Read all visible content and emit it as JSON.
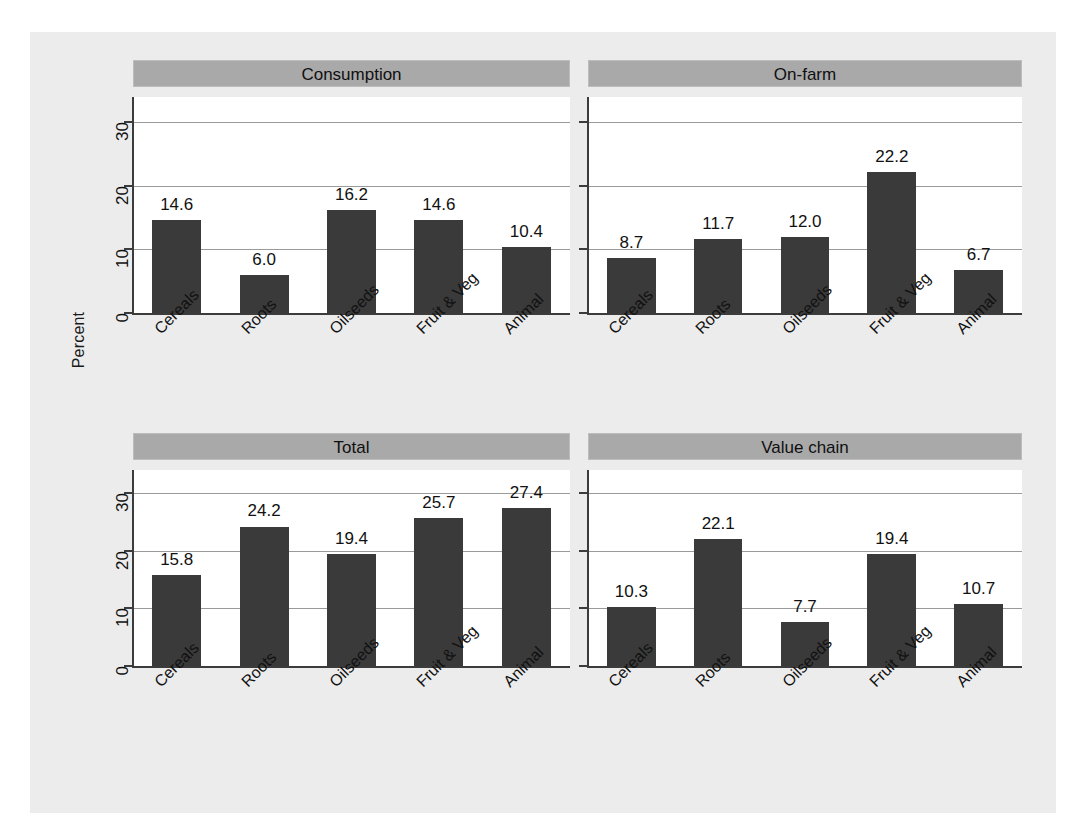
{
  "figure": {
    "ylabel": "Percent",
    "background": "#ececec",
    "bar_color": "#3a3a3a",
    "header_color": "#a9a9a9"
  },
  "chart_data": {
    "type": "bar",
    "title": "",
    "xlabel": "",
    "ylabel": "Percent",
    "ylim": [
      0,
      34
    ],
    "yticks": [
      0,
      10,
      20,
      30
    ],
    "grid": true,
    "legend": "none",
    "categories": [
      "Cereals",
      "Roots",
      "Oilseeds",
      "Fruit & Veg",
      "Animal"
    ],
    "panels": [
      {
        "title": "Consumption",
        "values": [
          14.6,
          6.0,
          16.2,
          14.6,
          10.4
        ],
        "labels": [
          "14.6",
          "6.0",
          "16.2",
          "14.6",
          "10.4"
        ],
        "show_yticks": true
      },
      {
        "title": "On-farm",
        "values": [
          8.7,
          11.7,
          12.0,
          22.2,
          6.7
        ],
        "labels": [
          "8.7",
          "11.7",
          "12.0",
          "22.2",
          "6.7"
        ],
        "show_yticks": false
      },
      {
        "title": "Total",
        "values": [
          15.8,
          24.2,
          19.4,
          25.7,
          27.4
        ],
        "labels": [
          "15.8",
          "24.2",
          "19.4",
          "25.7",
          "27.4"
        ],
        "show_yticks": true
      },
      {
        "title": "Value chain",
        "values": [
          10.3,
          22.1,
          7.7,
          19.4,
          10.7
        ],
        "labels": [
          "10.3",
          "22.1",
          "7.7",
          "19.4",
          "10.7"
        ],
        "show_yticks": false
      }
    ]
  }
}
